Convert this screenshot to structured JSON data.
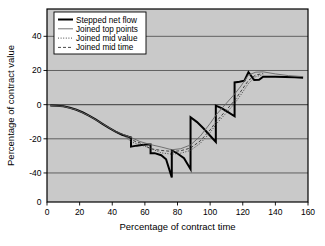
{
  "chart_data": {
    "type": "line",
    "title": "",
    "xlabel": "Percentage of contract time",
    "ylabel": "Percentage of contract value",
    "xlim": [
      0,
      160
    ],
    "ylim": [
      -57,
      56
    ],
    "xticks": [
      0,
      20,
      40,
      60,
      80,
      100,
      120,
      140,
      160
    ],
    "yticks": [
      40,
      20,
      0,
      -20,
      -40,
      0
    ],
    "ytick_labels": [
      "40",
      "20",
      "0",
      "-20",
      "-40",
      "0"
    ],
    "grid": "horizontal",
    "legend_position": "top-left",
    "plot_background": "#c9c9c9",
    "series": [
      {
        "name": "Stepped net flow",
        "style": "thick-solid",
        "color": "#000000",
        "points": [
          [
            2,
            -0.5
          ],
          [
            6,
            -0.6
          ],
          [
            10,
            -1.0
          ],
          [
            14,
            -1.8
          ],
          [
            18,
            -3.0
          ],
          [
            22,
            -4.6
          ],
          [
            26,
            -6.6
          ],
          [
            30,
            -8.8
          ],
          [
            34,
            -11.2
          ],
          [
            38,
            -13.6
          ],
          [
            42,
            -15.8
          ],
          [
            46,
            -17.6
          ],
          [
            50,
            -18.8
          ],
          [
            51.5,
            -19.2
          ],
          [
            51.5,
            -24.6
          ],
          [
            55,
            -24.0
          ],
          [
            58,
            -23.6
          ],
          [
            61,
            -23.4
          ],
          [
            63.5,
            -23.4
          ],
          [
            63.5,
            -28.4
          ],
          [
            66,
            -28.4
          ],
          [
            70,
            -29.6
          ],
          [
            73,
            -32.0
          ],
          [
            76.5,
            -42.6
          ],
          [
            76.5,
            -26.8
          ],
          [
            80,
            -28.6
          ],
          [
            84,
            -31.4
          ],
          [
            88,
            -37.8
          ],
          [
            88,
            -7.4
          ],
          [
            92,
            -10.2
          ],
          [
            96,
            -14.0
          ],
          [
            100,
            -18.2
          ],
          [
            103.5,
            -21.8
          ],
          [
            103.5,
            -0.6
          ],
          [
            107,
            -2.0
          ],
          [
            111,
            -4.4
          ],
          [
            115,
            -6.8
          ],
          [
            115,
            13.0
          ],
          [
            118,
            13.4
          ],
          [
            121,
            14.0
          ],
          [
            123.5,
            19.0
          ],
          [
            123.5,
            19.0
          ],
          [
            127,
            14.4
          ],
          [
            130,
            14.6
          ],
          [
            132.5,
            16.4
          ],
          [
            136,
            16.4
          ],
          [
            140,
            16.4
          ],
          [
            146,
            16.2
          ],
          [
            152,
            16.0
          ],
          [
            157,
            15.8
          ]
        ]
      },
      {
        "name": "Joined top points",
        "style": "thin-solid",
        "color": "#666666",
        "points": [
          [
            2,
            -0.5
          ],
          [
            10,
            -1.0
          ],
          [
            18,
            -3.0
          ],
          [
            26,
            -6.6
          ],
          [
            34,
            -11.2
          ],
          [
            42,
            -15.8
          ],
          [
            51.5,
            -19.2
          ],
          [
            57,
            -21.6
          ],
          [
            63.5,
            -23.4
          ],
          [
            70,
            -24.8
          ],
          [
            76.5,
            -26.4
          ],
          [
            82,
            -25.8
          ],
          [
            88,
            -23.6
          ],
          [
            94,
            -18.4
          ],
          [
            100,
            -11.0
          ],
          [
            103.5,
            -6.2
          ],
          [
            109,
            -0.2
          ],
          [
            115,
            6.2
          ],
          [
            119,
            11.0
          ],
          [
            123.5,
            17.4
          ],
          [
            128,
            19.0
          ],
          [
            132.5,
            19.2
          ],
          [
            140,
            18.0
          ],
          [
            148,
            17.0
          ],
          [
            157,
            16.4
          ]
        ]
      },
      {
        "name": "Joined mid value",
        "style": "dotted",
        "color": "#333333",
        "points": [
          [
            42,
            -15.8
          ],
          [
            47,
            -18.0
          ],
          [
            51.5,
            -21.8
          ],
          [
            57,
            -23.4
          ],
          [
            63.5,
            -25.6
          ],
          [
            70,
            -28.2
          ],
          [
            76.5,
            -29.0
          ],
          [
            82,
            -28.4
          ],
          [
            88,
            -26.8
          ],
          [
            94,
            -22.6
          ],
          [
            100,
            -16.4
          ],
          [
            103.5,
            -11.6
          ],
          [
            109,
            -5.8
          ],
          [
            115,
            0.6
          ],
          [
            119,
            6.0
          ],
          [
            123.5,
            12.4
          ],
          [
            128,
            16.4
          ],
          [
            132.5,
            17.6
          ]
        ]
      },
      {
        "name": "Joined mid time",
        "style": "dashed",
        "color": "#333333",
        "points": [
          [
            42,
            -15.8
          ],
          [
            47,
            -17.6
          ],
          [
            51.5,
            -20.6
          ],
          [
            57,
            -22.4
          ],
          [
            63.5,
            -25.8
          ],
          [
            70,
            -26.8
          ],
          [
            76.5,
            -27.4
          ],
          [
            82,
            -27.0
          ],
          [
            88,
            -25.4
          ],
          [
            94,
            -21.2
          ],
          [
            100,
            -14.8
          ],
          [
            103.5,
            -10.2
          ],
          [
            109,
            -4.2
          ],
          [
            115,
            2.4
          ],
          [
            119,
            8.0
          ],
          [
            123.5,
            14.2
          ],
          [
            128,
            17.4
          ],
          [
            132.5,
            18.2
          ]
        ]
      }
    ],
    "legend": [
      {
        "label": "Stepped net flow",
        "style": "thick-solid",
        "color": "#000000"
      },
      {
        "label": "Joined top points",
        "style": "thin-solid",
        "color": "#666666"
      },
      {
        "label": "Joined mid value",
        "style": "dotted",
        "color": "#333333"
      },
      {
        "label": "Joined mid time",
        "style": "dashed",
        "color": "#333333"
      }
    ]
  }
}
